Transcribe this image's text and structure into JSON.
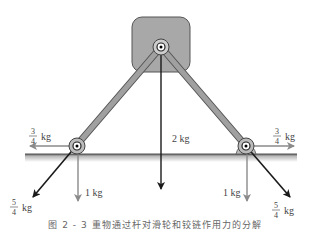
{
  "figure": {
    "caption": "图 2 - 3  重物通过杆对滑轮和铰链作用力的分解",
    "colors": {
      "block_fill": "#a8a8a8",
      "block_stroke": "#555555",
      "rod_fill": "#9a9a9a",
      "ground": "#555555",
      "dark_arrow": "#1a1a1a",
      "gray_arrow": "#8a8a8a"
    },
    "block": {
      "label": ""
    },
    "forces": {
      "weight": {
        "value": "2 kg"
      },
      "left_horizontal": {
        "num": "3",
        "den": "4",
        "unit": "kg"
      },
      "right_horizontal": {
        "num": "3",
        "den": "4",
        "unit": "kg"
      },
      "left_vertical": {
        "value": "1 kg"
      },
      "right_vertical": {
        "value": "1 kg"
      },
      "left_diagonal": {
        "num": "5",
        "den": "4",
        "unit": "kg"
      },
      "right_diagonal": {
        "num": "5",
        "den": "4",
        "unit": "kg"
      }
    }
  }
}
